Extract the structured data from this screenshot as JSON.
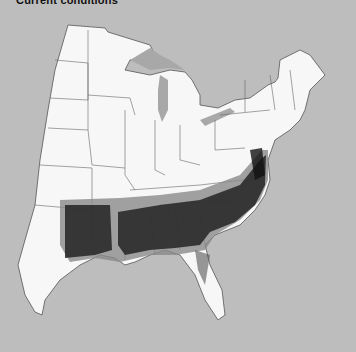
{
  "map": {
    "title": "Current conditions",
    "region": "Eastern United States",
    "colors": {
      "background": "#bdbdbd",
      "land": "#f7f7f7",
      "border": "#555555",
      "water": "#a8a8a8",
      "range_dense": "#1a1a1a",
      "range_medium": "#555555",
      "range_light": "#8a8a8a"
    }
  }
}
